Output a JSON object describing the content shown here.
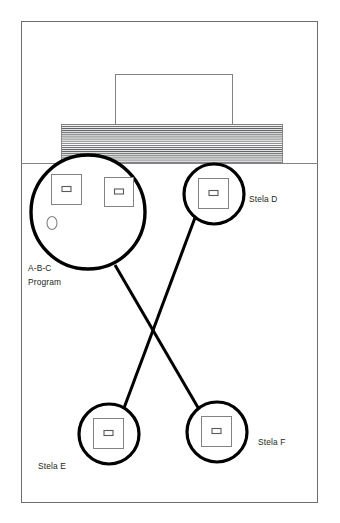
{
  "diagram": {
    "type": "site-plan",
    "canvas": {
      "width": 340,
      "height": 523
    },
    "colors": {
      "frame_stroke": "#6d6e71",
      "hatch_stroke": "#58595b",
      "thin_stroke": "#808285",
      "callout_stroke": "#000000",
      "text": "#231f20",
      "background": "#ffffff"
    },
    "frame": {
      "x": 21,
      "y": 21,
      "width": 297,
      "height": 482,
      "stroke_width": 1
    },
    "ground_line": {
      "x1": 21,
      "y1": 163,
      "x2": 318,
      "y2": 163,
      "stroke_width": 1
    },
    "structures": [
      {
        "name": "upper-building",
        "shape": "rectangle",
        "x": 115,
        "y": 74,
        "width": 118,
        "height": 51,
        "fill": "none",
        "stroke_width": 1
      },
      {
        "name": "hatched-platform",
        "shape": "rectangle-hatched",
        "x": 61,
        "y": 124,
        "width": 222,
        "height": 39,
        "hatch": "horizontal",
        "hatch_spacing": 2.1,
        "stroke_width": 0.9
      }
    ],
    "callouts": [
      {
        "id": "abc-program",
        "label": "A-B-C\nProgram",
        "label_lines": [
          "A-B-C",
          "Program"
        ],
        "label_x": 28,
        "label_y": 271,
        "circle": {
          "cx": 88,
          "cy": 212,
          "r": 57,
          "stroke_width": 3.4
        },
        "contents": [
          {
            "name": "stela-a-plan",
            "shape": "square",
            "x": 51,
            "y": 174,
            "size": 31,
            "inner": {
              "shape": "rectangle",
              "width": 9,
              "height": 5
            }
          },
          {
            "name": "stela-b-plan",
            "shape": "square",
            "x": 104,
            "y": 177,
            "size": 29,
            "inner": {
              "shape": "rectangle",
              "width": 9,
              "height": 5
            }
          },
          {
            "name": "altar-oval-plan",
            "shape": "ellipse",
            "cx": 52,
            "cy": 223,
            "rx": 5,
            "ry": 6.5
          }
        ]
      },
      {
        "id": "stela-d",
        "label": "Stela D",
        "label_x": 249,
        "label_y": 202,
        "circle": {
          "cx": 214,
          "cy": 194,
          "r": 30,
          "stroke_width": 3.2
        },
        "contents": [
          {
            "name": "stela-d-plan",
            "shape": "square",
            "x": 198,
            "y": 178,
            "size": 31,
            "inner": {
              "shape": "rectangle",
              "width": 9,
              "height": 5
            }
          }
        ]
      },
      {
        "id": "stela-e",
        "label": "Stela E",
        "label_x": 38,
        "label_y": 469,
        "circle": {
          "cx": 109,
          "cy": 434,
          "r": 30,
          "stroke_width": 3.2
        },
        "contents": [
          {
            "name": "stela-e-plan",
            "shape": "square",
            "x": 93,
            "y": 418,
            "size": 31,
            "inner": {
              "shape": "rectangle",
              "width": 9,
              "height": 5
            }
          }
        ]
      },
      {
        "id": "stela-f",
        "label": "Stela F",
        "label_x": 258,
        "label_y": 445,
        "circle": {
          "cx": 217,
          "cy": 432,
          "r": 30,
          "stroke_width": 3.2
        },
        "contents": [
          {
            "name": "stela-f-plan",
            "shape": "square",
            "x": 201,
            "y": 416,
            "size": 31,
            "inner": {
              "shape": "rectangle",
              "width": 9,
              "height": 5
            }
          }
        ]
      }
    ],
    "connectors": [
      {
        "name": "abc-to-stela-f",
        "from": "abc-program",
        "to": "stela-f",
        "x1": 115,
        "y1": 265,
        "x2": 200,
        "y2": 411,
        "stroke_width": 3
      },
      {
        "name": "stela-d-to-stela-e",
        "from": "stela-d",
        "to": "stela-e",
        "x1": 196,
        "y1": 215,
        "x2": 124,
        "y2": 408,
        "stroke_width": 3
      }
    ],
    "crossing_point": {
      "x": 150,
      "y": 325
    }
  }
}
